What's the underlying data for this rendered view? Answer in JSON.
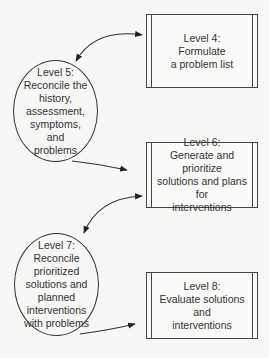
{
  "diagram": {
    "nodes": [
      {
        "id": "level4",
        "shape": "box",
        "lines": [
          "Level 4:",
          "Formulate",
          "a problem list"
        ]
      },
      {
        "id": "level5",
        "shape": "circle",
        "lines": [
          "Level 5:",
          "Reconcile the",
          "history,",
          "assessment,",
          "symptoms, and",
          "problems"
        ]
      },
      {
        "id": "level6",
        "shape": "box",
        "lines": [
          "Level 6:",
          "Generate and prioritize",
          "solutions and plans for",
          "interventions"
        ]
      },
      {
        "id": "level7",
        "shape": "circle",
        "lines": [
          "Level 7:",
          "Reconcile",
          "prioritized",
          "solutions and",
          "planned",
          "interventions",
          "with problems"
        ]
      },
      {
        "id": "level8",
        "shape": "box",
        "lines": [
          "Level 8:",
          "Evaluate solutions and",
          "interventions"
        ]
      }
    ],
    "edges": [
      {
        "from": "level4",
        "to": "level5",
        "type": "bidirectional"
      },
      {
        "from": "level5",
        "to": "level6",
        "type": "directed"
      },
      {
        "from": "level6",
        "to": "level7",
        "type": "bidirectional"
      },
      {
        "from": "level7",
        "to": "level8",
        "type": "directed"
      }
    ],
    "colors": {
      "line": "#333333",
      "background": "#f7f7f5"
    }
  }
}
